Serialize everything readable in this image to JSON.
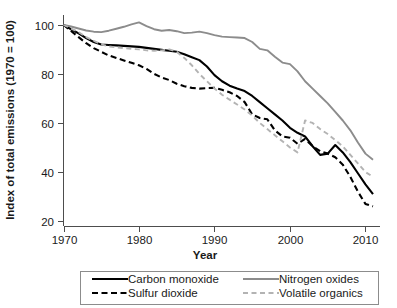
{
  "chart_data": {
    "type": "line",
    "title": "",
    "xlabel": "Year",
    "ylabel": "Index of total emissions (1970 = 100)",
    "xlim": [
      1970,
      2011
    ],
    "ylim": [
      18,
      104
    ],
    "xticks": [
      1970,
      1980,
      1990,
      2000,
      2010
    ],
    "yticks": [
      20,
      40,
      60,
      80,
      100
    ],
    "grid": false,
    "legend_position": "below-plot",
    "series": [
      {
        "name": "Carbon monoxide",
        "color": "#000000",
        "dash": "solid",
        "x": [
          1970,
          1971,
          1972,
          1973,
          1974,
          1975,
          1976,
          1977,
          1978,
          1979,
          1980,
          1981,
          1982,
          1983,
          1984,
          1985,
          1986,
          1987,
          1988,
          1989,
          1990,
          1991,
          1992,
          1993,
          1994,
          1995,
          1996,
          1997,
          1998,
          1999,
          2000,
          2001,
          2002,
          2003,
          2004,
          2005,
          2006,
          2007,
          2008,
          2009,
          2010,
          2011
        ],
        "y": [
          100,
          98.2,
          96.5,
          94.6,
          93.0,
          92.0,
          91.8,
          91.6,
          91.4,
          91.2,
          91.0,
          90.6,
          90.2,
          89.8,
          89.4,
          89.0,
          88.0,
          86.8,
          85.6,
          83.0,
          79.5,
          77.0,
          75.2,
          74.0,
          73.0,
          71.0,
          68.5,
          66.0,
          63.5,
          61.0,
          58.0,
          56.0,
          54.5,
          50.5,
          47.0,
          47.5,
          51.0,
          48.0,
          44.0,
          39.5,
          35.0,
          31.0
        ]
      },
      {
        "name": "Nitrogen oxides",
        "color": "#8c8c8c",
        "dash": "solid",
        "x": [
          1970,
          1971,
          1972,
          1973,
          1974,
          1975,
          1976,
          1977,
          1978,
          1979,
          1980,
          1981,
          1982,
          1983,
          1984,
          1985,
          1986,
          1987,
          1988,
          1989,
          1990,
          1991,
          1992,
          1993,
          1994,
          1995,
          1996,
          1997,
          1998,
          1999,
          2000,
          2001,
          2002,
          2003,
          2004,
          2005,
          2006,
          2007,
          2008,
          2009,
          2010,
          2011
        ],
        "y": [
          100,
          99.3,
          98.5,
          97.7,
          97.2,
          97.0,
          97.6,
          98.4,
          99.2,
          100.2,
          101.0,
          99.5,
          98.2,
          97.6,
          97.9,
          97.4,
          96.6,
          96.8,
          97.2,
          96.6,
          95.8,
          95.2,
          95.0,
          94.8,
          94.6,
          93.0,
          90.2,
          89.6,
          87.0,
          84.6,
          84.0,
          81.0,
          77.0,
          74.0,
          71.0,
          68.0,
          64.5,
          61.0,
          57.0,
          52.0,
          47.5,
          45.0
        ]
      },
      {
        "name": "Sulfur dioxide",
        "color": "#000000",
        "dash": "dashed",
        "x": [
          1970,
          1971,
          1972,
          1973,
          1974,
          1975,
          1976,
          1977,
          1978,
          1979,
          1980,
          1981,
          1982,
          1983,
          1984,
          1985,
          1986,
          1987,
          1988,
          1989,
          1990,
          1991,
          1992,
          1993,
          1994,
          1995,
          1996,
          1997,
          1998,
          1999,
          2000,
          2001,
          2002,
          2003,
          2004,
          2005,
          2006,
          2007,
          2008,
          2009,
          2010,
          2011
        ],
        "y": [
          100,
          97.5,
          95.0,
          92.5,
          90.5,
          89.0,
          87.5,
          86.5,
          85.5,
          84.5,
          83.5,
          82.0,
          80.0,
          78.5,
          77.5,
          76.0,
          75.0,
          74.3,
          74.0,
          74.2,
          74.3,
          73.5,
          72.5,
          71.0,
          68.5,
          63.5,
          62.0,
          61.5,
          57.0,
          54.5,
          54.0,
          51.5,
          53.5,
          50.5,
          48.5,
          47.5,
          46.0,
          43.0,
          38.0,
          32.0,
          27.0,
          26.0
        ]
      },
      {
        "name": "Volatile organics",
        "color": "#b3b3b3",
        "dash": "dashed",
        "x": [
          1970,
          1971,
          1972,
          1973,
          1974,
          1975,
          1976,
          1977,
          1978,
          1979,
          1980,
          1981,
          1982,
          1983,
          1984,
          1985,
          1986,
          1987,
          1988,
          1989,
          1990,
          1991,
          1992,
          1993,
          1994,
          1995,
          1996,
          1997,
          1998,
          1999,
          2000,
          2001,
          2002,
          2003,
          2004,
          2005,
          2006,
          2007,
          2008,
          2009,
          2010,
          2011
        ],
        "y": [
          100,
          98.5,
          97.0,
          95.0,
          93.5,
          92.0,
          91.2,
          90.8,
          90.5,
          90.2,
          90.0,
          89.6,
          89.4,
          89.6,
          90.0,
          89.0,
          86.5,
          83.5,
          80.0,
          77.0,
          74.0,
          71.5,
          69.5,
          67.5,
          65.5,
          63.0,
          60.0,
          57.5,
          55.0,
          52.5,
          50.0,
          48.0,
          61.0,
          60.0,
          57.5,
          55.5,
          53.0,
          50.5,
          47.0,
          43.5,
          40.0,
          38.0
        ]
      }
    ]
  },
  "axes": {
    "xlabel": "Year",
    "ylabel": "Index of total emissions (1970 = 100)",
    "xtick_labels": [
      "1970",
      "1980",
      "1990",
      "2000",
      "2010"
    ],
    "ytick_labels": [
      "20",
      "40",
      "60",
      "80",
      "100"
    ]
  },
  "legend": {
    "items": [
      {
        "label": "Carbon monoxide",
        "color": "#000000",
        "dash": "solid"
      },
      {
        "label": "Nitrogen oxides",
        "color": "#8c8c8c",
        "dash": "solid"
      },
      {
        "label": "Sulfur dioxide",
        "color": "#000000",
        "dash": "dashed"
      },
      {
        "label": "Volatile organics",
        "color": "#b3b3b3",
        "dash": "dashed"
      }
    ]
  }
}
